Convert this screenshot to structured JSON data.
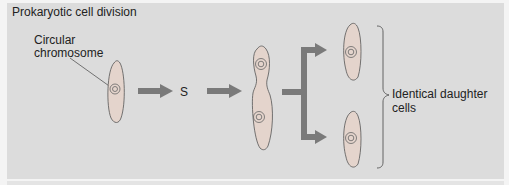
{
  "figure": {
    "title": "Prokaryotic cell division",
    "labels": {
      "chromosome": [
        "Circular",
        "chromosome"
      ],
      "phase": "S",
      "daughters": "Identical daughter cells"
    },
    "colors": {
      "background": "#dcdcdc",
      "arrow": "#7a7a7a",
      "cell_fill": "#e4d4cc",
      "outline": "#555555"
    }
  }
}
